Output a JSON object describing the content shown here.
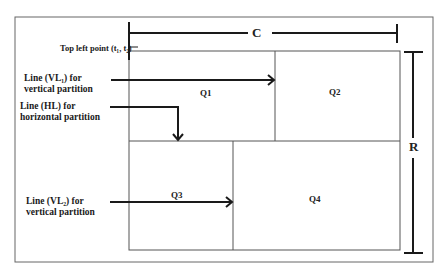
{
  "diagram": {
    "dimensions": {
      "width_label": "C",
      "height_label": "R"
    },
    "top_left_point": "Top left point (t₁, t₂)",
    "annotations": {
      "vl1": "Line (VL₁) for vertical partition",
      "hl": "Line (HL) for horizontal partition",
      "vl2": "Line (VL₂) for vertical partition"
    },
    "quadrants": [
      "Q1",
      "Q2",
      "Q3",
      "Q4"
    ],
    "colors": {
      "line": "#1a1a1a",
      "frame": "#555555",
      "background": "#ffffff"
    }
  }
}
